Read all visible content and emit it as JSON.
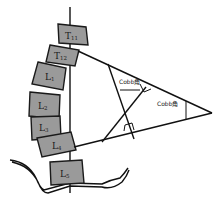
{
  "diagram": {
    "title": "",
    "vertebrae": [
      {
        "id": "T11",
        "letter": "T",
        "sub": "11"
      },
      {
        "id": "T12",
        "letter": "T",
        "sub": "12"
      },
      {
        "id": "L1",
        "letter": "L",
        "sub": "1"
      },
      {
        "id": "L2",
        "letter": "L",
        "sub": "2"
      },
      {
        "id": "L3",
        "letter": "L",
        "sub": "3"
      },
      {
        "id": "L4",
        "letter": "L",
        "sub": "4"
      },
      {
        "id": "L5",
        "letter": "L",
        "sub": "5"
      }
    ],
    "labels": {
      "cobb_inner": "Cobb角",
      "cobb_outer": "Cobb角"
    },
    "colors": {
      "vertebra_fill": "#9a9a9a",
      "stroke": "#111111",
      "background": "#ffffff"
    }
  }
}
